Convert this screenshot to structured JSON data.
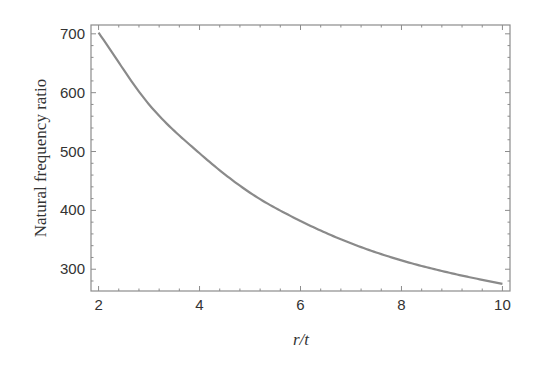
{
  "chart_data": {
    "type": "line",
    "title": "",
    "xlabel": "r/t",
    "ylabel": "Natural frequency ratio",
    "xlim": [
      1.85,
      10.15
    ],
    "ylim": [
      263,
      715
    ],
    "x_ticks": [
      2,
      4,
      6,
      8,
      10
    ],
    "y_ticks": [
      300,
      400,
      500,
      600,
      700
    ],
    "grid": false,
    "legend": null,
    "series": [
      {
        "name": "Natural frequency ratio",
        "color": "#8a8a8a",
        "x": [
          2,
          3,
          4,
          5,
          6,
          7,
          8,
          9,
          10
        ],
        "y": [
          702,
          580,
          497,
          430,
          382,
          344,
          315,
          293,
          275
        ]
      }
    ]
  },
  "colors": {
    "frame": "#8c8c8c",
    "curve": "#8a8a8a",
    "text": "#333333"
  }
}
